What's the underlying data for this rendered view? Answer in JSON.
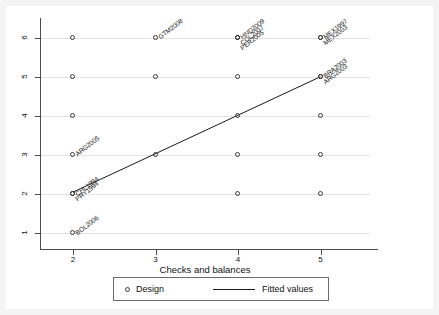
{
  "figure": {
    "background_color": "#f4f4f4",
    "plot_background_color": "#ffffff",
    "axis_color": "#4d4d4d",
    "grid_color": "#e3e3e3",
    "marker_color": "#3b3b3b",
    "line_color": "#1a1a1a"
  },
  "legend": {
    "design_label": "Design",
    "fitted_label": "Fitted values",
    "design_icon": "circle-marker-icon",
    "fitted_icon": "line-segment-icon"
  },
  "chart_data": {
    "type": "scatter",
    "title": "",
    "xlabel": "Checks and balances",
    "ylabel": "",
    "xlim": [
      1.6,
      5.6
    ],
    "ylim": [
      0.7,
      6.5
    ],
    "xticks": [
      "2",
      "3",
      "4",
      "5"
    ],
    "yticks": [
      "1",
      "2",
      "3",
      "4",
      "5",
      "6"
    ],
    "grid": "horizontal",
    "legend_position": "below-axis",
    "series": [
      {
        "name": "Design",
        "marker": "open-circle",
        "points": [
          {
            "x": 2,
            "y": 6,
            "label": ""
          },
          {
            "x": 2,
            "y": 5,
            "label": ""
          },
          {
            "x": 2,
            "y": 4,
            "label": ""
          },
          {
            "x": 2,
            "y": 3,
            "label": "ARG2005"
          },
          {
            "x": 2,
            "y": 2,
            "label": "CHL1994"
          },
          {
            "x": 2,
            "y": 2,
            "label": "PRY1994"
          },
          {
            "x": 2,
            "y": 1,
            "label": "BOL2006"
          },
          {
            "x": 3,
            "y": 6,
            "label": "GTM2008"
          },
          {
            "x": 3,
            "y": 5,
            "label": ""
          },
          {
            "x": 3,
            "y": 3,
            "label": ""
          },
          {
            "x": 4,
            "y": 6,
            "label": "HND2009"
          },
          {
            "x": 4,
            "y": 6,
            "label": "COL2007"
          },
          {
            "x": 4,
            "y": 6,
            "label": "PER2005"
          },
          {
            "x": 4,
            "y": 5,
            "label": ""
          },
          {
            "x": 4,
            "y": 4,
            "label": ""
          },
          {
            "x": 4,
            "y": 3,
            "label": ""
          },
          {
            "x": 4,
            "y": 2,
            "label": ""
          },
          {
            "x": 5,
            "y": 6,
            "label": "MEX1997"
          },
          {
            "x": 5,
            "y": 6,
            "label": "MEX2003"
          },
          {
            "x": 5,
            "y": 5,
            "label": "BRA2003"
          },
          {
            "x": 5,
            "y": 5,
            "label": "ARG2003"
          },
          {
            "x": 5,
            "y": 4,
            "label": ""
          },
          {
            "x": 5,
            "y": 3,
            "label": ""
          },
          {
            "x": 5,
            "y": 2,
            "label": ""
          }
        ]
      },
      {
        "name": "Fitted values",
        "type": "line",
        "x": [
          2,
          5
        ],
        "y": [
          2.05,
          5.0
        ]
      }
    ]
  }
}
